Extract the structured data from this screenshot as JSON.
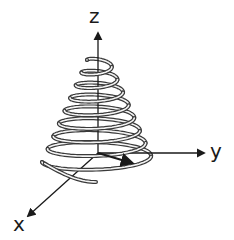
{
  "diagram": {
    "type": "conical-helix-3d-axes",
    "colors": {
      "axis": "#1a1a1a",
      "helix_outline": "#3a3a3a",
      "helix_fill": "#f4f4f4",
      "background": "#ffffff"
    },
    "origin": [
      98,
      153
    ],
    "axes": [
      {
        "name": "z",
        "label": "z",
        "end": [
          98,
          33
        ],
        "label_pos": [
          89,
          6
        ]
      },
      {
        "name": "y",
        "label": "y",
        "end": [
          204,
          153
        ],
        "label_pos": [
          210,
          141
        ]
      },
      {
        "name": "x",
        "label": "x",
        "end": [
          28,
          216
        ],
        "label_pos": [
          13,
          214
        ]
      }
    ],
    "helix": {
      "turns": 8,
      "center_x": 98,
      "top_y": 60,
      "bottom_y": 162,
      "top_radius_x": 11,
      "bottom_radius_x": 56,
      "ellipse_ratio": 0.16,
      "tube_width": 4,
      "tail_end": [
        96,
        182
      ]
    },
    "vector": {
      "from": [
        98,
        153
      ],
      "to": [
        132,
        163
      ]
    }
  }
}
